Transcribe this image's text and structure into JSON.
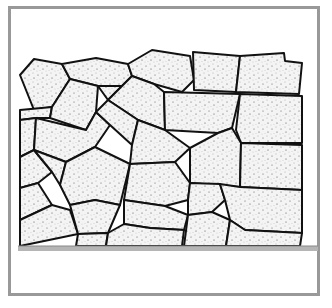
{
  "figure": {
    "title": "",
    "frame_color": "#999999",
    "stone_fill": "#f4f4f4",
    "outline_color": "#111111",
    "ground_color": "#9a9a9a"
  },
  "stones": [
    {
      "points": "20,75 34,59 62,64 70,79 52,107 34,110"
    },
    {
      "points": "62,64 96,58 128,64 132,76 122,86 98,86 70,79"
    },
    {
      "points": "128,64 152,50 190,56 194,80 182,92 154,84 132,76"
    },
    {
      "points": "193,52 240,56 236,92 194,90"
    },
    {
      "points": "240,56 284,53 285,61 302,63 299,94 236,92"
    },
    {
      "points": "20,110 52,107 50,118 36,118 20,120"
    },
    {
      "points": "52,107 70,79 98,86 96,112 86,130 50,118"
    },
    {
      "points": "98,86 122,86 108,100"
    },
    {
      "points": "122,86 132,76 154,84 164,92 165,130 138,120 108,100"
    },
    {
      "points": "165,130 164,92 240,94 232,128 218,133"
    },
    {
      "points": "240,94 302,96 302,143 241,143 236,130"
    },
    {
      "points": "20,120 36,118 34,150 20,157"
    },
    {
      "points": "36,118 86,130 96,112 110,125 95,147 66,162 34,150"
    },
    {
      "points": "96,112 108,100 138,120 132,145 110,125"
    },
    {
      "points": "132,145 138,120 165,130 190,148 175,162 130,164"
    },
    {
      "points": "218,133 232,128 241,143 240,187 190,183 190,148"
    },
    {
      "points": "241,143 302,145 302,190 240,187"
    },
    {
      "points": "20,157 34,150 52,172 38,183 20,188"
    },
    {
      "points": "34,150 66,162 60,185 52,172"
    },
    {
      "points": "66,162 95,147 130,164 120,205 95,200 70,205 60,185"
    },
    {
      "points": "130,164 175,162 190,183 188,200 165,206 124,200"
    },
    {
      "points": "190,183 220,184 225,200 212,212 188,215 188,200"
    },
    {
      "points": "220,184 240,187 302,190 302,233 245,230 230,220 225,200"
    },
    {
      "points": "20,188 38,183 52,205 20,220"
    },
    {
      "points": "20,220 52,205 70,210 78,234 20,246"
    },
    {
      "points": "70,205 95,200 120,205 108,233 78,234"
    },
    {
      "points": "124,200 165,206 188,215 184,230 150,228 124,224"
    },
    {
      "points": "188,215 212,212 230,220 226,246 184,246"
    },
    {
      "points": "230,220 245,230 302,233 300,246 226,246"
    },
    {
      "points": "78,234 108,233 106,246 76,246"
    },
    {
      "points": "108,233 124,224 150,228 184,230 182,246 106,246"
    }
  ],
  "ground": {
    "y": 246,
    "x1": 18,
    "x2": 318
  }
}
